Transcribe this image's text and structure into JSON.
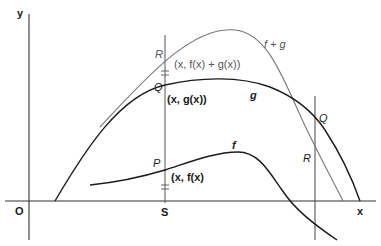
{
  "diagram": {
    "axes": {
      "y_label": "y",
      "x_label": "x",
      "origin_label": "O"
    },
    "vertical_line_left": {
      "foot_label": "S",
      "point_R_label": "R",
      "point_Q_label": "Q",
      "point_P_label": "P",
      "coord_fg": "(x, f(x) + g(x))",
      "coord_g": "(x, g(x))",
      "coord_f": "(x, f(x)"
    },
    "vertical_line_right": {
      "point_Q_label": "Q",
      "point_R_label": "R"
    },
    "curves": {
      "f_plus_g": {
        "label": "f + g",
        "color": "#777777"
      },
      "g": {
        "label": "g",
        "color": "#1a1a1a"
      },
      "f": {
        "label": "f",
        "color": "#1a1a1a"
      }
    },
    "colors": {
      "axis": "#333333",
      "background": "#ffffff"
    }
  }
}
